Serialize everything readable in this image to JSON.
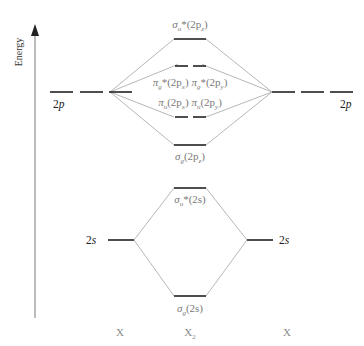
{
  "diagram": {
    "type": "molecular-orbital-diagram",
    "axis": {
      "label": "Energy"
    },
    "atomic_orbitals": {
      "left_2p": "2p",
      "right_2p": "2p",
      "left_2s": "2s",
      "right_2s": "2s"
    },
    "molecular_orbitals": {
      "sigma_u_star_2pz": {
        "base": "σ",
        "sub": "u",
        "tail": "*(2p",
        "tail_sub": "z",
        "close": ")"
      },
      "pi_g_star_2px": {
        "base": "π",
        "sub": "g",
        "tail": "*(2p",
        "tail_sub": "x",
        "close": ")"
      },
      "pi_g_star_2py": {
        "base": "π",
        "sub": "g",
        "tail": "*(2p",
        "tail_sub": "y",
        "close": ")"
      },
      "pi_u_2px": {
        "base": "π",
        "sub": "u",
        "tail": "(2p",
        "tail_sub": "x",
        "close": ")"
      },
      "pi_u_2py": {
        "base": "π",
        "sub": "u",
        "tail": "(2p",
        "tail_sub": "y",
        "close": ")"
      },
      "sigma_g_2pz": {
        "base": "σ",
        "sub": "g",
        "tail": "(2p",
        "tail_sub": "z",
        "close": ")"
      },
      "sigma_u_star_2s": {
        "base": "σ",
        "sub": "u",
        "tail": "*(2s)"
      },
      "sigma_g_2s": {
        "base": "σ",
        "sub": "g",
        "tail": "(2s)"
      }
    },
    "bottom_labels": {
      "left": {
        "base": "X"
      },
      "center": {
        "base": "X",
        "sub": "2"
      },
      "right": {
        "base": "X"
      }
    },
    "colors": {
      "level_line": "#222222",
      "connector_line": "#b5b5b5",
      "mo_label": "#7a7a7a",
      "axis": "#888888"
    }
  }
}
